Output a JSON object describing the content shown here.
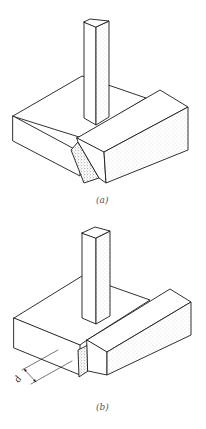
{
  "figure": {
    "colors": {
      "line": "#1a1a1a",
      "background": "#ffffff",
      "caption": "#555555"
    },
    "panels": [
      {
        "id": "a",
        "caption": "(a)",
        "note": "Beam end with inclined cut face against footing"
      },
      {
        "id": "b",
        "caption": "(b)",
        "note": "Beam end with vertical face; depth dimension shown",
        "dimension_label": "d"
      }
    ]
  }
}
